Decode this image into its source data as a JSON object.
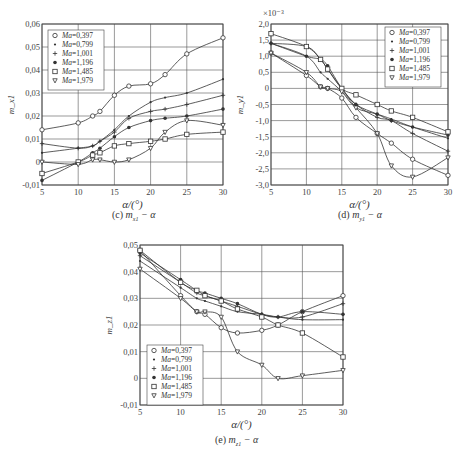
{
  "chart_data": [
    {
      "id": "c",
      "type": "line",
      "caption": "(c) m_x1 − α",
      "caption_label": "(c)",
      "caption_var": "m",
      "caption_sub": "x1",
      "caption_rest": " − α",
      "xlabel": "α/(°)",
      "ylabel": "m_x1",
      "xlim": [
        5,
        30
      ],
      "ylim": [
        -0.01,
        0.06
      ],
      "xticks": [
        5,
        10,
        15,
        20,
        25,
        30
      ],
      "yticks": [
        -0.01,
        0,
        0.01,
        0.02,
        0.03,
        0.04,
        0.05,
        0.06
      ],
      "ytick_labels": [
        "-0,01",
        "0",
        "0,01",
        "0,02",
        "0,03",
        "0,04",
        "0,05",
        "0,06"
      ],
      "grid": true,
      "legend_position": "upper left",
      "x": [
        5,
        10,
        12,
        13,
        15,
        17,
        20,
        22,
        25,
        30
      ],
      "series": [
        {
          "name": "Ma=0,397",
          "marker": "circle",
          "values": [
            0.014,
            0.017,
            0.02,
            0.022,
            0.029,
            0.033,
            0.034,
            0.038,
            0.047,
            0.054
          ]
        },
        {
          "name": "Ma=0,799",
          "marker": "dot",
          "values": [
            0.004,
            0.006,
            0.007,
            0.009,
            0.014,
            0.02,
            0.026,
            0.028,
            0.03,
            0.036
          ]
        },
        {
          "name": "Ma=1,001",
          "marker": "plus",
          "values": [
            0.008,
            0.006,
            0.007,
            0.009,
            0.013,
            0.019,
            0.022,
            0.023,
            0.025,
            0.029
          ]
        },
        {
          "name": "Ma=1,196",
          "marker": "filled-circle",
          "values": [
            -0.008,
            0.0,
            0.004,
            0.006,
            0.011,
            0.015,
            0.018,
            0.019,
            0.02,
            0.023
          ]
        },
        {
          "name": "Ma=1,485",
          "marker": "square",
          "values": [
            -0.005,
            0.0,
            0.003,
            0.004,
            0.007,
            0.008,
            0.009,
            0.01,
            0.012,
            0.013
          ]
        },
        {
          "name": "Ma=1,979",
          "marker": "triangle-down",
          "values": [
            0.0,
            -0.001,
            0.001,
            0.001,
            0.0,
            0.001,
            0.006,
            0.013,
            0.018,
            0.016
          ]
        }
      ]
    },
    {
      "id": "d",
      "type": "line",
      "caption": "(d) m_y1 − α",
      "caption_label": "(d)",
      "caption_var": "m",
      "caption_sub": "y1",
      "caption_rest": " − α",
      "xlabel": "α/(°)",
      "ylabel": "m_y1",
      "y_multiplier": "×10⁻³",
      "xlim": [
        5,
        30
      ],
      "ylim": [
        -3.0,
        2.0
      ],
      "xticks": [
        5,
        10,
        15,
        20,
        25,
        30
      ],
      "yticks": [
        -3.0,
        -2.5,
        -2.0,
        -1.5,
        -1.0,
        -0.5,
        0,
        0.5,
        1.0,
        1.5,
        2.0
      ],
      "ytick_labels": [
        "-3,0",
        "-2,5",
        "-2,0",
        "-1,5",
        "-1,0",
        "-0,5",
        "0",
        "0,5",
        "1,0",
        "1,5",
        "2,0"
      ],
      "grid": true,
      "legend_position": "upper right",
      "x": [
        5,
        10,
        12,
        13,
        15,
        17,
        20,
        22,
        25,
        30
      ],
      "series": [
        {
          "name": "Ma=0,397",
          "marker": "circle",
          "values": [
            1.1,
            0.4,
            0.05,
            0.0,
            -0.3,
            -0.9,
            -1.4,
            -1.7,
            -2.2,
            -2.7
          ]
        },
        {
          "name": "Ma=0,799",
          "marker": "dot",
          "values": [
            1.4,
            1.0,
            0.5,
            0.3,
            -0.1,
            -0.6,
            -0.8,
            -0.95,
            -1.2,
            -1.55
          ]
        },
        {
          "name": "Ma=1,001",
          "marker": "plus",
          "values": [
            1.4,
            1.3,
            0.9,
            0.6,
            0.0,
            -0.5,
            -0.9,
            -1.0,
            -1.4,
            -1.95
          ]
        },
        {
          "name": "Ma=1,196",
          "marker": "filled-circle",
          "values": [
            1.4,
            1.0,
            0.9,
            0.7,
            0.0,
            -0.5,
            -0.8,
            -1.0,
            -1.2,
            -1.45
          ]
        },
        {
          "name": "Ma=1,485",
          "marker": "square",
          "values": [
            1.7,
            1.3,
            0.9,
            0.6,
            0.0,
            -0.2,
            -0.5,
            -0.7,
            -0.9,
            -1.35
          ]
        },
        {
          "name": "Ma=1,979",
          "marker": "triangle-down",
          "values": [
            1.1,
            0.5,
            0.05,
            0.0,
            -0.1,
            -0.6,
            -1.4,
            -2.4,
            -2.75,
            -2.15
          ]
        }
      ]
    },
    {
      "id": "e",
      "type": "line",
      "caption": "(e) m_z1 − α",
      "caption_label": "(e)",
      "caption_var": "m",
      "caption_sub": "z1",
      "caption_rest": " − α",
      "xlabel": "α/(°)",
      "ylabel": "m_z1",
      "xlim": [
        5,
        30
      ],
      "ylim": [
        -0.01,
        0.05
      ],
      "xticks": [
        5,
        10,
        15,
        20,
        25,
        30
      ],
      "yticks": [
        -0.01,
        0,
        0.01,
        0.02,
        0.03,
        0.04,
        0.05
      ],
      "ytick_labels": [
        "-0,01",
        "0",
        "0,01",
        "0,02",
        "0,03",
        "0,04",
        "0,05"
      ],
      "grid": true,
      "legend_position": "lower left",
      "x": [
        5,
        10,
        12,
        13,
        15,
        17,
        20,
        22,
        25,
        30
      ],
      "series": [
        {
          "name": "Ma=0,397",
          "marker": "circle",
          "values": [
            0.048,
            0.031,
            0.025,
            0.024,
            0.019,
            0.017,
            0.018,
            0.02,
            0.025,
            0.031
          ]
        },
        {
          "name": "Ma=0,799",
          "marker": "dot",
          "values": [
            0.044,
            0.034,
            0.03,
            0.029,
            0.027,
            0.025,
            0.024,
            0.023,
            0.022,
            0.022
          ]
        },
        {
          "name": "Ma=1,001",
          "marker": "plus",
          "values": [
            0.046,
            0.036,
            0.032,
            0.031,
            0.029,
            0.027,
            0.024,
            0.023,
            0.023,
            0.028
          ]
        },
        {
          "name": "Ma=1,196",
          "marker": "filled-circle",
          "values": [
            0.047,
            0.037,
            0.033,
            0.032,
            0.03,
            0.028,
            0.024,
            0.023,
            0.025,
            0.024
          ]
        },
        {
          "name": "Ma=1,485",
          "marker": "square",
          "values": [
            0.048,
            0.036,
            0.033,
            0.031,
            0.029,
            0.026,
            0.023,
            0.02,
            0.017,
            0.008
          ]
        },
        {
          "name": "Ma=1,979",
          "marker": "triangle-down",
          "values": [
            0.041,
            0.03,
            0.025,
            0.025,
            0.023,
            0.01,
            0.005,
            0.0,
            0.001,
            0.003
          ]
        }
      ]
    }
  ]
}
